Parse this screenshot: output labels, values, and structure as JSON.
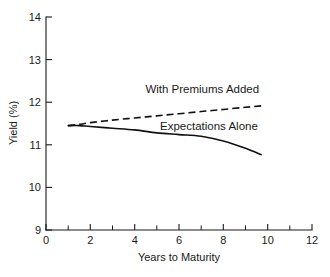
{
  "chart_data": {
    "type": "line",
    "title": "",
    "xlabel": "Years to Maturity",
    "ylabel": "Yield (%)",
    "xlim": [
      0,
      12
    ],
    "ylim": [
      9,
      14
    ],
    "grid": false,
    "legend_position": "inline-annotations",
    "x_ticks_major": [
      0,
      2,
      4,
      6,
      8,
      10,
      12
    ],
    "x_ticks_major_labels": [
      "0",
      "2",
      "4",
      "6",
      "8",
      "10",
      "12"
    ],
    "x_ticks_minor": [
      1,
      3,
      5,
      7,
      9,
      11
    ],
    "y_ticks_major": [
      9,
      10,
      11,
      12,
      13,
      14
    ],
    "y_ticks_major_labels": [
      "9",
      "10",
      "11",
      "12",
      "13",
      "14"
    ],
    "series": [
      {
        "name": "With Premiums Added",
        "style": "dashed",
        "x": [
          1.0,
          1.5,
          2.0,
          3.0,
          4.0,
          5.0,
          6.0,
          7.0,
          8.0,
          9.0,
          9.85
        ],
        "values": [
          11.45,
          11.48,
          11.52,
          11.58,
          11.63,
          11.68,
          11.73,
          11.78,
          11.83,
          11.88,
          11.92
        ]
      },
      {
        "name": "Expectations Alone",
        "style": "solid",
        "x": [
          1.0,
          1.5,
          2.0,
          3.0,
          4.0,
          5.0,
          6.0,
          7.0,
          8.0,
          9.0,
          9.7
        ],
        "values": [
          11.45,
          11.45,
          11.43,
          11.39,
          11.35,
          11.28,
          11.24,
          11.2,
          11.09,
          10.92,
          10.77
        ]
      }
    ],
    "annotations": [
      {
        "text": "With Premiums Added",
        "x": 7.05,
        "y": 12.22
      },
      {
        "text": "Expectations Alone",
        "x": 7.35,
        "y": 11.35
      }
    ]
  }
}
